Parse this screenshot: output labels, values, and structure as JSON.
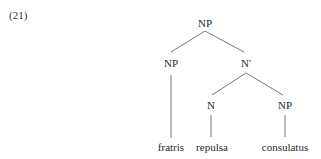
{
  "example": {
    "number": "(21)"
  },
  "tree": {
    "root": {
      "label": "NP"
    },
    "left_np": {
      "label": "NP",
      "leaf": "fratris"
    },
    "n_bar": {
      "label": "N'"
    },
    "n": {
      "label": "N",
      "leaf": "repulsa"
    },
    "right_np": {
      "label": "NP",
      "leaf": "consulatus"
    }
  },
  "colors": {
    "text": "#2a2a2a",
    "lines": "#555555",
    "background": "#ffffff"
  }
}
